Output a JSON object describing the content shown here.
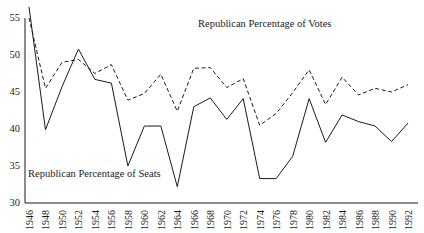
{
  "chart_data": {
    "type": "line",
    "title": "",
    "xlabel": "",
    "ylabel": "",
    "ylim": [
      30,
      55
    ],
    "xlim": [
      1946,
      1992
    ],
    "grid": false,
    "legend_position": "inline-annotations",
    "y_ticks": [
      30,
      35,
      40,
      45,
      50,
      55
    ],
    "y_tick_labels": [
      "30",
      "35",
      "40",
      "45",
      "50",
      "55"
    ],
    "x_ticks": [
      1946,
      1948,
      1950,
      1952,
      1954,
      1956,
      1958,
      1960,
      1962,
      1964,
      1966,
      1968,
      1970,
      1972,
      1974,
      1976,
      1978,
      1980,
      1982,
      1984,
      1986,
      1988,
      1990,
      1992
    ],
    "x_tick_labels": [
      "1946",
      "1948",
      "1950",
      "1952",
      "1954",
      "1956",
      "1958",
      "1960",
      "1962",
      "1964",
      "1966",
      "1968",
      "1970",
      "1972",
      "1974",
      "1976",
      "1978",
      "1980",
      "1982",
      "1984",
      "1986",
      "1988",
      "1990",
      "1992"
    ],
    "categories": [
      1946,
      1948,
      1950,
      1952,
      1954,
      1956,
      1958,
      1960,
      1962,
      1964,
      1966,
      1968,
      1970,
      1972,
      1974,
      1976,
      1978,
      1980,
      1982,
      1984,
      1986,
      1988,
      1990,
      1992
    ],
    "series": [
      {
        "name": "Republican Percentage of Votes",
        "style": "dashed",
        "color": "#1a1a1a",
        "values": [
          55.0,
          45.5,
          49.0,
          49.4,
          47.5,
          48.7,
          43.9,
          44.8,
          47.4,
          42.4,
          48.2,
          48.3,
          45.6,
          46.8,
          40.5,
          42.1,
          44.9,
          48.0,
          43.3,
          47.0,
          44.6,
          45.5,
          45.0,
          46.0
        ]
      },
      {
        "name": "Republican Percentage of Seats",
        "style": "solid",
        "color": "#1a1a1a",
        "values": [
          56.5,
          39.9,
          45.7,
          50.8,
          46.7,
          46.2,
          35.0,
          40.4,
          40.4,
          32.2,
          43.0,
          44.2,
          41.3,
          44.1,
          33.3,
          33.3,
          36.3,
          44.1,
          38.2,
          41.9,
          41.0,
          40.4,
          38.3,
          40.8
        ]
      }
    ],
    "annotations": [
      {
        "text": "Republican Percentage of Votes",
        "x": 1967,
        "y": 54
      },
      {
        "text": "Republican Percentage of Seats",
        "x": 1947,
        "y": 33.5
      }
    ]
  },
  "colors": {
    "ink": "#1a1a1a",
    "background": "#ffffff"
  }
}
